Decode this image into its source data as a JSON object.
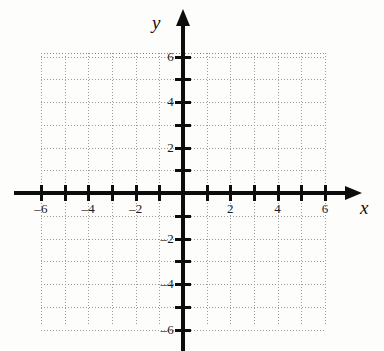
{
  "figure": {
    "type": "coordinate-plane",
    "background_color": "#fdfdfc",
    "axis_color": "#0d0d0d",
    "grid_color": "#9b9b9b"
  },
  "axes": {
    "x": {
      "name": "x",
      "min": -6,
      "max": 6,
      "tick_interval": 1,
      "labeled_ticks": [
        -6,
        -4,
        -2,
        2,
        4,
        6
      ],
      "labels": [
        "–6",
        "–4",
        "–2",
        "2",
        "4",
        "6"
      ],
      "has_arrow_positive": true,
      "has_arrow_negative": false
    },
    "y": {
      "name": "y",
      "min": -6,
      "max": 6,
      "tick_interval": 1,
      "labeled_ticks": [
        6,
        4,
        2,
        -2,
        -4,
        -6
      ],
      "labels": [
        "6",
        "4",
        "2",
        "–2",
        "–4",
        "–6"
      ],
      "has_arrow_positive": true,
      "has_arrow_negative": false
    }
  },
  "chart_data": {
    "type": "scatter",
    "title": "",
    "xlabel": "x",
    "ylabel": "y",
    "xlim": [
      -6,
      6
    ],
    "ylim": [
      -6,
      6
    ],
    "xticks": [
      -6,
      -5,
      -4,
      -3,
      -2,
      -1,
      0,
      1,
      2,
      3,
      4,
      5,
      6
    ],
    "yticks": [
      -6,
      -5,
      -4,
      -3,
      -2,
      -1,
      0,
      1,
      2,
      3,
      4,
      5,
      6
    ],
    "xtick_labels": [
      "–6",
      "",
      "–4",
      "",
      "–2",
      "",
      "",
      "",
      "2",
      "",
      "4",
      "",
      "6"
    ],
    "ytick_labels": [
      "–6",
      "",
      "–4",
      "",
      "–2",
      "",
      "",
      "",
      "2",
      "",
      "4",
      "",
      "6"
    ],
    "grid": true,
    "grid_style": "dotted",
    "legend": false,
    "series": [],
    "x": [],
    "y": []
  }
}
